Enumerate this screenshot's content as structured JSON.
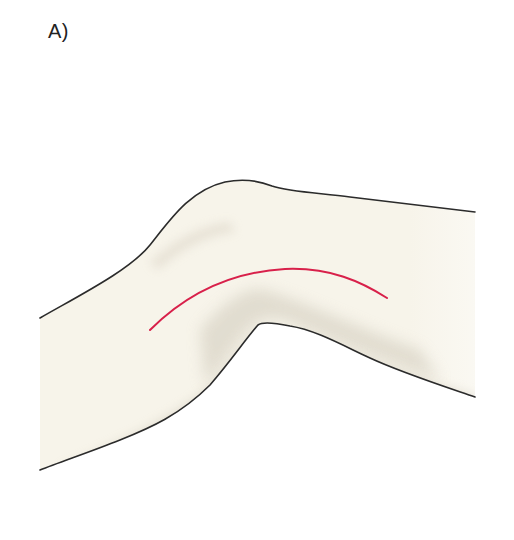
{
  "figure": {
    "panel_label": "A)",
    "colors": {
      "skin_fill": "#f7f4ea",
      "shadow": "#d9d4c8",
      "outline": "#2b2b2b",
      "incision_line": "#d8204a",
      "background": "#ffffff"
    },
    "annotations": [
      {
        "type": "curved-line",
        "meaning": "incision-line",
        "color": "#d8204a"
      }
    ]
  }
}
